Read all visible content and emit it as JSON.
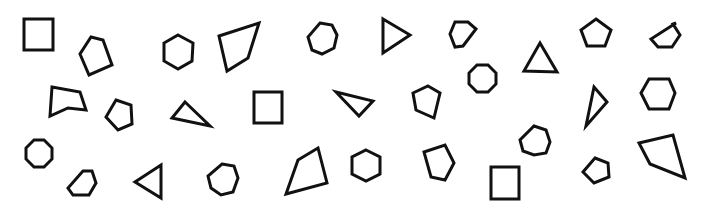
{
  "figure": {
    "stroke_color": "#111111",
    "background_color": "#ffffff"
  },
  "shapes": [
    {
      "name": "square",
      "sides": 4,
      "points": [
        [
          24,
          19
        ],
        [
          53,
          19
        ],
        [
          53,
          50
        ],
        [
          24,
          50
        ]
      ]
    },
    {
      "name": "pentagon-irregular",
      "sides": 5,
      "points": [
        [
          91,
          37
        ],
        [
          103,
          40
        ],
        [
          112,
          65
        ],
        [
          89,
          75
        ],
        [
          80,
          54
        ]
      ]
    },
    {
      "name": "hexagon",
      "sides": 6,
      "points": [
        [
          178,
          35
        ],
        [
          193,
          43
        ],
        [
          192,
          61
        ],
        [
          178,
          69
        ],
        [
          164,
          61
        ],
        [
          164,
          43
        ]
      ]
    },
    {
      "name": "quadrilateral",
      "sides": 4,
      "points": [
        [
          219,
          36
        ],
        [
          259,
          23
        ],
        [
          248,
          58
        ],
        [
          227,
          71
        ]
      ]
    },
    {
      "name": "heptagon",
      "sides": 7,
      "points": [
        [
          320,
          23
        ],
        [
          332,
          25
        ],
        [
          337,
          35
        ],
        [
          334,
          48
        ],
        [
          322,
          54
        ],
        [
          312,
          50
        ],
        [
          308,
          37
        ]
      ]
    },
    {
      "name": "triangle",
      "sides": 3,
      "points": [
        [
          383,
          19
        ],
        [
          410,
          35
        ],
        [
          383,
          53
        ]
      ]
    },
    {
      "name": "hexagon-irregular",
      "sides": 6,
      "points": [
        [
          455,
          22
        ],
        [
          468,
          22
        ],
        [
          476,
          29
        ],
        [
          463,
          46
        ],
        [
          455,
          47
        ],
        [
          450,
          34
        ]
      ]
    },
    {
      "name": "triangle",
      "sides": 3,
      "points": [
        [
          540,
          43
        ],
        [
          557,
          72
        ],
        [
          524,
          71
        ]
      ]
    },
    {
      "name": "pentagon",
      "sides": 5,
      "points": [
        [
          596,
          19
        ],
        [
          611,
          30
        ],
        [
          605,
          46
        ],
        [
          587,
          46
        ],
        [
          581,
          30
        ]
      ]
    },
    {
      "name": "hexagon-irregular",
      "sides": 6,
      "points": [
        [
          676,
          23
        ],
        [
          673,
          24
        ],
        [
          680,
          35
        ],
        [
          672,
          47
        ],
        [
          658,
          47
        ],
        [
          651,
          39
        ]
      ]
    },
    {
      "name": "octagon",
      "sides": 8,
      "points": [
        [
          477,
          65
        ],
        [
          488,
          65
        ],
        [
          496,
          73
        ],
        [
          496,
          84
        ],
        [
          488,
          92
        ],
        [
          477,
          92
        ],
        [
          469,
          84
        ],
        [
          469,
          73
        ]
      ]
    },
    {
      "name": "pentagon-irregular",
      "sides": 5,
      "points": [
        [
          52,
          87
        ],
        [
          80,
          92
        ],
        [
          86,
          110
        ],
        [
          68,
          108
        ],
        [
          50,
          116
        ]
      ]
    },
    {
      "name": "pentagon",
      "sides": 5,
      "points": [
        [
          116,
          100
        ],
        [
          131,
          105
        ],
        [
          132,
          124
        ],
        [
          118,
          130
        ],
        [
          106,
          117
        ]
      ]
    },
    {
      "name": "triangle",
      "sides": 3,
      "points": [
        [
          185,
          102
        ],
        [
          210,
          126
        ],
        [
          172,
          118
        ]
      ]
    },
    {
      "name": "square",
      "sides": 4,
      "points": [
        [
          254,
          92
        ],
        [
          282,
          92
        ],
        [
          282,
          123
        ],
        [
          254,
          123
        ]
      ]
    },
    {
      "name": "triangle",
      "sides": 3,
      "points": [
        [
          336,
          92
        ],
        [
          373,
          101
        ],
        [
          359,
          116
        ]
      ]
    },
    {
      "name": "pentagon",
      "sides": 5,
      "points": [
        [
          428,
          86
        ],
        [
          440,
          93
        ],
        [
          434,
          118
        ],
        [
          416,
          110
        ],
        [
          413,
          93
        ]
      ]
    },
    {
      "name": "triangle",
      "sides": 3,
      "points": [
        [
          594,
          87
        ],
        [
          607,
          102
        ],
        [
          586,
          126
        ]
      ]
    },
    {
      "name": "hexagon",
      "sides": 6,
      "points": [
        [
          649,
          79
        ],
        [
          669,
          79
        ],
        [
          675,
          93
        ],
        [
          669,
          109
        ],
        [
          649,
          109
        ],
        [
          641,
          93
        ]
      ]
    },
    {
      "name": "octagon",
      "sides": 8,
      "points": [
        [
          34,
          140
        ],
        [
          44,
          140
        ],
        [
          52,
          148
        ],
        [
          52,
          159
        ],
        [
          44,
          167
        ],
        [
          34,
          167
        ],
        [
          26,
          159
        ],
        [
          26,
          148
        ]
      ]
    },
    {
      "name": "hexagon-irregular",
      "sides": 6,
      "points": [
        [
          83,
          171
        ],
        [
          92,
          171
        ],
        [
          96,
          183
        ],
        [
          89,
          195
        ],
        [
          73,
          195
        ],
        [
          68,
          188
        ]
      ]
    },
    {
      "name": "triangle",
      "sides": 3,
      "points": [
        [
          161,
          165
        ],
        [
          161,
          198
        ],
        [
          135,
          182
        ]
      ]
    },
    {
      "name": "heptagon",
      "sides": 7,
      "points": [
        [
          222,
          164
        ],
        [
          234,
          166
        ],
        [
          238,
          178
        ],
        [
          233,
          192
        ],
        [
          221,
          195
        ],
        [
          211,
          188
        ],
        [
          208,
          176
        ]
      ]
    },
    {
      "name": "quadrilateral",
      "sides": 4,
      "points": [
        [
          298,
          160
        ],
        [
          318,
          148
        ],
        [
          327,
          183
        ],
        [
          286,
          194
        ]
      ]
    },
    {
      "name": "hexagon",
      "sides": 6,
      "points": [
        [
          366,
          150
        ],
        [
          380,
          157
        ],
        [
          380,
          174
        ],
        [
          366,
          181
        ],
        [
          352,
          174
        ],
        [
          352,
          157
        ]
      ]
    },
    {
      "name": "pentagon-irregular",
      "sides": 5,
      "points": [
        [
          424,
          152
        ],
        [
          445,
          145
        ],
        [
          454,
          163
        ],
        [
          445,
          180
        ],
        [
          431,
          177
        ]
      ]
    },
    {
      "name": "heptagon",
      "sides": 7,
      "points": [
        [
          534,
          126
        ],
        [
          546,
          130
        ],
        [
          550,
          142
        ],
        [
          546,
          153
        ],
        [
          534,
          155
        ],
        [
          523,
          151
        ],
        [
          520,
          140
        ]
      ]
    },
    {
      "name": "square",
      "sides": 4,
      "points": [
        [
          491,
          167
        ],
        [
          519,
          167
        ],
        [
          519,
          199
        ],
        [
          491,
          199
        ]
      ]
    },
    {
      "name": "pentagon",
      "sides": 5,
      "points": [
        [
          595,
          158
        ],
        [
          608,
          163
        ],
        [
          609,
          177
        ],
        [
          594,
          183
        ],
        [
          583,
          172
        ]
      ]
    },
    {
      "name": "quadrilateral",
      "sides": 4,
      "points": [
        [
          639,
          143
        ],
        [
          673,
          135
        ],
        [
          685,
          178
        ],
        [
          650,
          164
        ]
      ]
    }
  ]
}
